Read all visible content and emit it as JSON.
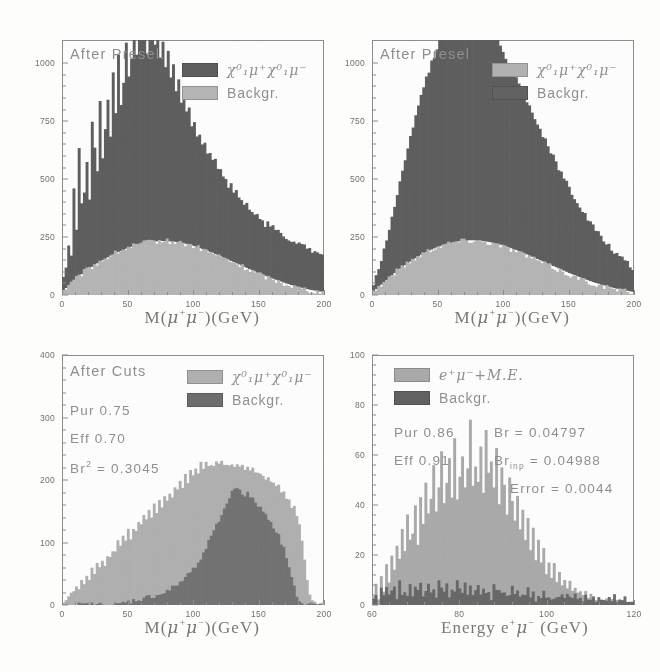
{
  "figure": {
    "background": "#fdfdfc",
    "panels": 4
  },
  "colors": {
    "signal_dark": "#5a5a5a",
    "background_light": "#b4b4b4",
    "signal_light": "#b0b0b0",
    "background_dark": "#5e5e5e",
    "axis": "#8a8a8a",
    "text": "#8d8d8d"
  },
  "panel_tl": {
    "title": "After Presel.",
    "legend": [
      {
        "label_html": "signal",
        "swatch": "#5a5a5a",
        "name": "chi0-mu-pair"
      },
      {
        "label_html": "Backgr.",
        "swatch": "#b4b4b4",
        "name": "background"
      }
    ],
    "legend_labels": {
      "signal": "χ⁰₁μ⁺χ⁰₁μ⁻",
      "background": "Backgr."
    },
    "xlabel": "M(μ⁺μ⁻)(GeV)",
    "yticks": [
      "0",
      "250",
      "500",
      "750",
      "1000"
    ],
    "xticks": [
      "0",
      "50",
      "100",
      "150",
      "200"
    ]
  },
  "panel_tr": {
    "title": "After Presel",
    "legend": [
      {
        "label_html": "signal",
        "swatch": "#b0b0b0",
        "name": "chi0-mu-pair"
      },
      {
        "label_html": "Backgr.",
        "swatch": "#5e5e5e",
        "name": "background"
      }
    ],
    "legend_labels": {
      "signal": "χ⁰₁μ⁺χ⁰₁μ⁻",
      "background": "Backgr."
    },
    "xlabel": "M(μ⁺μ⁻)(GeV)",
    "yticks": [
      "0",
      "250",
      "500",
      "750",
      "1000"
    ],
    "xticks": [
      "0",
      "50",
      "100",
      "150",
      "200"
    ]
  },
  "panel_bl": {
    "title": "After Cuts",
    "stats": [
      "Pur 0.75",
      "Eff 0.70"
    ],
    "stat_pur": "Pur 0.75",
    "stat_eff": "Eff 0.70",
    "stat_br2_label": "Br",
    "stat_br2_value": "= 0.3045",
    "legend_labels": {
      "signal": "χ⁰₁μ⁺χ⁰₁μ⁻",
      "background": "Backgr."
    },
    "xlabel": "M(μ⁺μ⁻)(GeV)",
    "yticks": [
      "0",
      "100",
      "200",
      "300",
      "400"
    ],
    "xticks": [
      "0",
      "50",
      "100",
      "150",
      "200"
    ]
  },
  "panel_br": {
    "legend_labels": {
      "signal": "e⁺μ⁻+M.E.",
      "background": "Backgr."
    },
    "stat_pur": "Pur 0.86",
    "stat_eff": "Eff 0.91",
    "stat_br": "Br = 0.04797",
    "stat_brinp_label": "Br",
    "stat_brinp_sub": "inp",
    "stat_brinp_value": "= 0.04988",
    "stat_error": "Error = 0.0044",
    "xlabel": "Energy e⁺μ⁻ (GeV)",
    "yticks": [
      "0",
      "20",
      "40",
      "60",
      "80",
      "100"
    ],
    "xticks": [
      "60",
      "80",
      "100",
      "120"
    ]
  },
  "chart_data": [
    {
      "id": "top-left",
      "type": "bar",
      "title": "After Presel.",
      "xlabel": "M(mu+ mu-)(GeV)",
      "ylabel": "",
      "xlim": [
        0,
        200
      ],
      "ylim": [
        0,
        1100
      ],
      "yticks": [
        0,
        250,
        500,
        750,
        1000
      ],
      "xticks": [
        0,
        50,
        100,
        150,
        200
      ],
      "grid": false,
      "legend_position": "top-right",
      "stacked": true,
      "bin_width": 2,
      "series": [
        {
          "name": "chi0_1 mu+ chi0_1 mu-",
          "color": "#5a5a5a",
          "values": [
            60,
            95,
            180,
            130,
            400,
            220,
            560,
            300,
            350,
            470,
            300,
            620,
            500,
            390,
            700,
            430,
            560,
            690,
            520,
            780,
            600,
            860,
            640,
            720,
            900,
            730,
            800,
            940,
            820,
            1000,
            880,
            950,
            820,
            1010,
            900,
            860,
            940,
            800,
            870,
            760,
            820,
            700,
            760,
            640,
            700,
            610,
            660,
            560,
            600,
            520,
            540,
            470,
            500,
            440,
            460,
            420,
            430,
            390,
            400,
            360,
            380,
            340,
            350,
            320,
            330,
            300,
            310,
            280,
            290,
            265,
            275,
            250,
            260,
            240,
            250,
            230,
            240,
            220,
            230,
            215,
            225,
            205,
            215,
            200,
            205,
            195,
            200,
            190,
            195,
            185,
            190,
            180,
            185,
            175,
            180,
            170,
            175,
            165,
            170,
            160
          ]
        },
        {
          "name": "Backgr.",
          "color": "#b4b4b4",
          "values": [
            20,
            30,
            40,
            50,
            60,
            70,
            80,
            90,
            100,
            108,
            115,
            122,
            130,
            137,
            144,
            150,
            157,
            163,
            170,
            175,
            180,
            186,
            190,
            195,
            200,
            204,
            208,
            212,
            215,
            218,
            221,
            224,
            226,
            228,
            230,
            231,
            232,
            233,
            233,
            233,
            232,
            231,
            230,
            229,
            227,
            225,
            223,
            220,
            217,
            214,
            211,
            207,
            203,
            199,
            195,
            191,
            186,
            182,
            177,
            172,
            167,
            162,
            157,
            152,
            147,
            142,
            137,
            132,
            127,
            122,
            117,
            112,
            107,
            102,
            97,
            92,
            88,
            83,
            79,
            74,
            70,
            66,
            62,
            58,
            54,
            50,
            47,
            43,
            40,
            37,
            34,
            31,
            28,
            26,
            23,
            21,
            19,
            17,
            15,
            13,
            11
          ]
        }
      ]
    },
    {
      "id": "top-right",
      "type": "bar",
      "title": "After Presel",
      "xlabel": "M(mu+ mu-)(GeV)",
      "ylabel": "",
      "xlim": [
        0,
        200
      ],
      "ylim": [
        0,
        1100
      ],
      "yticks": [
        0,
        250,
        500,
        750,
        1000
      ],
      "xticks": [
        0,
        50,
        100,
        150,
        200
      ],
      "grid": false,
      "legend_position": "top-right",
      "stacked": true,
      "bin_width": 2,
      "series": [
        {
          "name": "chi0_1 mu+ chi0_1 mu-",
          "color": "#5a5a5a",
          "values": [
            30,
            55,
            80,
            110,
            140,
            175,
            210,
            250,
            290,
            330,
            370,
            410,
            450,
            490,
            530,
            570,
            610,
            650,
            690,
            720,
            750,
            780,
            805,
            830,
            855,
            880,
            900,
            920,
            940,
            955,
            970,
            985,
            995,
            1005,
            1000,
            1010,
            990,
            1000,
            975,
            985,
            960,
            965,
            940,
            930,
            920,
            900,
            890,
            870,
            855,
            835,
            820,
            800,
            785,
            765,
            745,
            725,
            705,
            685,
            665,
            645,
            625,
            605,
            585,
            565,
            545,
            525,
            505,
            487,
            470,
            452,
            435,
            418,
            400,
            385,
            368,
            352,
            337,
            322,
            307,
            292,
            278,
            265,
            252,
            240,
            228,
            216,
            205,
            195,
            185,
            175,
            166,
            157,
            148,
            140,
            132,
            124,
            117,
            110,
            100
          ]
        },
        {
          "name": "Backgr.",
          "color": "#b4b4b4",
          "values": [
            15,
            25,
            35,
            45,
            55,
            65,
            75,
            85,
            95,
            105,
            113,
            121,
            129,
            137,
            144,
            152,
            159,
            166,
            173,
            179,
            185,
            191,
            196,
            201,
            206,
            210,
            214,
            218,
            221,
            224,
            227,
            229,
            231,
            233,
            234,
            235,
            236,
            236,
            236,
            235,
            234,
            233,
            232,
            230,
            228,
            226,
            223,
            220,
            217,
            214,
            210,
            206,
            202,
            198,
            194,
            189,
            185,
            180,
            175,
            170,
            165,
            160,
            155,
            150,
            145,
            140,
            135,
            130,
            125,
            120,
            115,
            110,
            105,
            100,
            95,
            90,
            86,
            81,
            77,
            72,
            68,
            64,
            60,
            56,
            52,
            49,
            45,
            42,
            39,
            36,
            33,
            30,
            27,
            25,
            22,
            20,
            18,
            16,
            14,
            12,
            10
          ]
        }
      ]
    },
    {
      "id": "bottom-left",
      "type": "bar",
      "title": "After Cuts",
      "xlabel": "M(mu+ mu-)(GeV)",
      "ylabel": "",
      "xlim": [
        0,
        200
      ],
      "ylim": [
        0,
        400
      ],
      "yticks": [
        0,
        100,
        200,
        300,
        400
      ],
      "xticks": [
        0,
        50,
        100,
        150,
        200
      ],
      "grid": false,
      "legend_position": "top-right",
      "stacked": false,
      "annotations": [
        "Pur 0.75",
        "Eff 0.70",
        "Br^2 = 0.3045"
      ],
      "bin_width": 2,
      "series": [
        {
          "name": "chi0_1 mu+ chi0_1 mu-",
          "color": "#aeaeae",
          "values": [
            5,
            10,
            14,
            22,
            18,
            30,
            26,
            40,
            34,
            48,
            42,
            58,
            50,
            66,
            58,
            74,
            66,
            82,
            74,
            90,
            82,
            100,
            92,
            108,
            100,
            118,
            108,
            126,
            116,
            134,
            126,
            142,
            134,
            150,
            142,
            158,
            150,
            166,
            158,
            174,
            166,
            182,
            175,
            190,
            182,
            198,
            190,
            206,
            198,
            214,
            205,
            220,
            212,
            226,
            218,
            230,
            222,
            228,
            224,
            232,
            227,
            230,
            225,
            228,
            223,
            226,
            222,
            224,
            220,
            222,
            218,
            220,
            214,
            216,
            210,
            212,
            206,
            208,
            200,
            202,
            194,
            196,
            188,
            190,
            180,
            182,
            170,
            172,
            158,
            160,
            140,
            130,
            100,
            70,
            40,
            18,
            6,
            2,
            0,
            0,
            0
          ]
        },
        {
          "name": "Backgr.",
          "color": "#6a6a6a",
          "values": [
            0,
            0,
            0,
            0,
            0,
            0,
            0,
            0,
            0,
            0,
            0,
            0,
            0,
            0,
            0,
            0,
            0,
            0,
            0,
            0,
            0,
            0,
            2,
            3,
            4,
            5,
            6,
            7,
            8,
            9,
            10,
            11,
            12,
            13,
            14,
            15,
            16,
            17,
            18,
            20,
            22,
            24,
            27,
            30,
            33,
            36,
            40,
            44,
            48,
            53,
            58,
            64,
            70,
            77,
            84,
            92,
            100,
            108,
            117,
            126,
            135,
            145,
            155,
            163,
            172,
            180,
            186,
            190,
            185,
            180,
            176,
            178,
            172,
            168,
            165,
            160,
            155,
            150,
            145,
            140,
            133,
            126,
            118,
            110,
            100,
            90,
            78,
            64,
            48,
            30,
            14,
            5,
            1,
            0,
            0,
            0,
            0,
            0,
            0,
            0,
            0
          ]
        }
      ]
    },
    {
      "id": "bottom-right",
      "type": "bar",
      "title": "",
      "xlabel": "Energy e+ mu- (GeV)",
      "ylabel": "",
      "xlim": [
        60,
        120
      ],
      "ylim": [
        0,
        100
      ],
      "yticks": [
        0,
        20,
        40,
        60,
        80,
        100
      ],
      "xticks": [
        60,
        80,
        100,
        120
      ],
      "grid": false,
      "legend_position": "top-left",
      "stacked": false,
      "annotations": [
        "Pur 0.86",
        "Eff 0.91",
        "Br = 0.04797",
        "Br_inp = 0.04988",
        "Error = 0.0044"
      ],
      "bin_width": 0.6,
      "series": [
        {
          "name": "e+ mu- + M.E.",
          "color": "#a8a8a8",
          "values": [
            4,
            8,
            2,
            12,
            6,
            16,
            9,
            20,
            14,
            24,
            18,
            30,
            22,
            36,
            26,
            28,
            40,
            24,
            44,
            32,
            50,
            36,
            42,
            56,
            38,
            46,
            62,
            40,
            48,
            58,
            44,
            66,
            42,
            52,
            60,
            46,
            54,
            74,
            48,
            56,
            50,
            64,
            44,
            70,
            52,
            58,
            46,
            62,
            40,
            54,
            48,
            36,
            50,
            42,
            34,
            44,
            30,
            38,
            26,
            34,
            22,
            30,
            18,
            26,
            16,
            22,
            13,
            18,
            11,
            16,
            9,
            13,
            7,
            11,
            6,
            9,
            5,
            7,
            4,
            6,
            3,
            5,
            2,
            4,
            2,
            3,
            2,
            3,
            1,
            2,
            1,
            2,
            1,
            1,
            0,
            1,
            0,
            1,
            0,
            0
          ]
        },
        {
          "name": "Backgr.",
          "color": "#5e5e5e",
          "values": [
            2,
            4,
            1,
            6,
            3,
            8,
            4,
            5,
            7,
            3,
            9,
            5,
            6,
            4,
            8,
            3,
            7,
            5,
            9,
            4,
            6,
            8,
            5,
            7,
            4,
            9,
            6,
            5,
            8,
            4,
            7,
            5,
            9,
            6,
            4,
            8,
            5,
            7,
            4,
            6,
            9,
            5,
            7,
            4,
            6,
            3,
            8,
            5,
            7,
            4,
            6,
            3,
            5,
            7,
            4,
            6,
            3,
            5,
            4,
            6,
            3,
            5,
            2,
            4,
            3,
            5,
            2,
            4,
            3,
            2,
            4,
            3,
            5,
            2,
            4,
            3,
            2,
            4,
            2,
            3,
            2,
            4,
            3,
            2,
            3,
            2,
            4,
            2,
            3,
            2,
            3,
            2,
            4,
            2,
            3,
            2,
            3,
            2,
            2,
            1
          ]
        }
      ]
    }
  ]
}
